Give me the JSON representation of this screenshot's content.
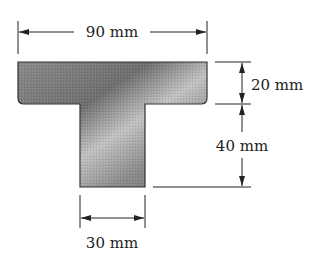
{
  "diagram": {
    "type": "T-section cross-section",
    "dimensions": {
      "flange_width": "90 mm",
      "flange_thickness": "20 mm",
      "web_height": "40 mm",
      "web_width": "30 mm"
    }
  },
  "colors": {
    "line": "#222222",
    "shape_dark": "#6e6e6e",
    "shape_light": "#c4c4c4"
  }
}
